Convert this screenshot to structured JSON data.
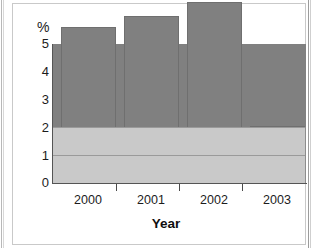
{
  "chart_data": {
    "type": "bar",
    "title": "",
    "categories": [
      "2000",
      "2001",
      "2002",
      "2003"
    ],
    "values": [
      3.0,
      3.6,
      4.0,
      4.5
    ],
    "xlabel": "Year",
    "ylabel": "%",
    "ylim": [
      0,
      5
    ],
    "yticks": [
      "0",
      "1",
      "2",
      "3",
      "4",
      "5"
    ],
    "grid": true,
    "legend": false,
    "colors": {
      "bar_fill": "#808080",
      "bar_edge": "#6f6f6f",
      "plot_band_upper": "#b0b0b0",
      "plot_band_lower": "#c9c9c9",
      "gridline": "#9a9a9a",
      "axis": "#555555",
      "text": "#1c1c1c",
      "frame": "#c9c9c9"
    }
  },
  "axes": {
    "y_unit_label": "%",
    "x_title": "Year"
  }
}
